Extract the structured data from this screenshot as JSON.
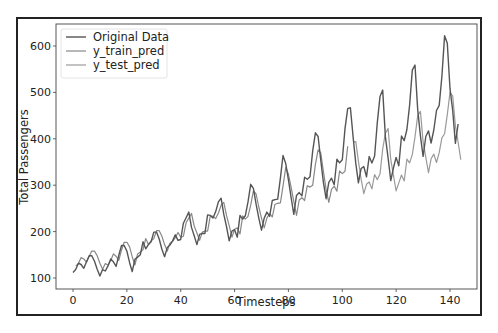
{
  "chart_data": {
    "type": "line",
    "title": "",
    "xlabel": "Timesteps",
    "ylabel": "Total Passengers",
    "xlim": [
      -7,
      150
    ],
    "ylim": [
      78,
      645
    ],
    "xticks": [
      0,
      20,
      40,
      60,
      80,
      100,
      120,
      140
    ],
    "yticks": [
      100,
      200,
      300,
      400,
      500,
      600
    ],
    "grid": false,
    "legend_position": "upper left",
    "legend": [
      "Original Data",
      "y_train_pred",
      "y_test_pred"
    ],
    "series": [
      {
        "name": "Original Data",
        "color": "#555555",
        "x_start": 0,
        "values": [
          112,
          118,
          132,
          129,
          121,
          135,
          148,
          148,
          136,
          119,
          104,
          118,
          115,
          126,
          141,
          135,
          125,
          149,
          170,
          170,
          158,
          133,
          114,
          140,
          145,
          150,
          178,
          163,
          172,
          178,
          199,
          199,
          184,
          162,
          146,
          166,
          171,
          180,
          193,
          181,
          183,
          218,
          230,
          242,
          209,
          191,
          172,
          194,
          196,
          196,
          236,
          235,
          229,
          243,
          264,
          272,
          237,
          211,
          180,
          201,
          204,
          188,
          235,
          227,
          234,
          264,
          302,
          293,
          259,
          229,
          203,
          229,
          242,
          233,
          267,
          269,
          270,
          315,
          364,
          347,
          312,
          274,
          237,
          278,
          284,
          277,
          317,
          313,
          318,
          374,
          413,
          405,
          355,
          306,
          271,
          306,
          315,
          301,
          356,
          348,
          355,
          422,
          465,
          467,
          404,
          347,
          305,
          336,
          340,
          318,
          362,
          348,
          363,
          435,
          491,
          505,
          404,
          359,
          310,
          337,
          360,
          342,
          406,
          396,
          420,
          472,
          548,
          559,
          463,
          407,
          362,
          405,
          417,
          391,
          419,
          461,
          472,
          535,
          622,
          606,
          508,
          461,
          390,
          432
        ]
      },
      {
        "name": "y_train_pred",
        "color": "#888888",
        "x_start": 1,
        "values": [
          126,
          131,
          144,
          141,
          134,
          147,
          158,
          158,
          148,
          132,
          119,
          131,
          128,
          138,
          152,
          147,
          138,
          160,
          177,
          177,
          167,
          146,
          128,
          152,
          156,
          161,
          185,
          172,
          180,
          185,
          202,
          202,
          190,
          172,
          158,
          175,
          179,
          187,
          198,
          188,
          190,
          219,
          229,
          239,
          212,
          197,
          181,
          199,
          201,
          201,
          234,
          233,
          228,
          240,
          257,
          263,
          235,
          213,
          188,
          205,
          208,
          195,
          234,
          227,
          233,
          257,
          288,
          281,
          253,
          229,
          208,
          229,
          239,
          232,
          259,
          261,
          262,
          298,
          338,
          324,
          296,
          265,
          235,
          268,
          273,
          267,
          299,
          296,
          300,
          345,
          376,
          370,
          330,
          291,
          263,
          291,
          298,
          287,
          331,
          325,
          330,
          384
        ]
      },
      {
        "name": "y_test_pred",
        "color": "#9a9a9a",
        "x_start": 104,
        "values": [
          393,
          394,
          352,
          313,
          282,
          302,
          307,
          292,
          323,
          312,
          324,
          378,
          412,
          422,
          355,
          322,
          288,
          305,
          322,
          309,
          356,
          348,
          366,
          404,
          450,
          459,
          394,
          360,
          327,
          357,
          367,
          349,
          370,
          402,
          411,
          452,
          500,
          492,
          428,
          393,
          355
        ]
      }
    ]
  },
  "legend": {
    "items": [
      {
        "label": "Original Data",
        "color": "#555555"
      },
      {
        "label": "y_train_pred",
        "color": "#888888"
      },
      {
        "label": "y_test_pred",
        "color": "#9a9a9a"
      }
    ]
  },
  "axes": {
    "xlabel": "Timesteps",
    "ylabel": "Total Passengers"
  }
}
